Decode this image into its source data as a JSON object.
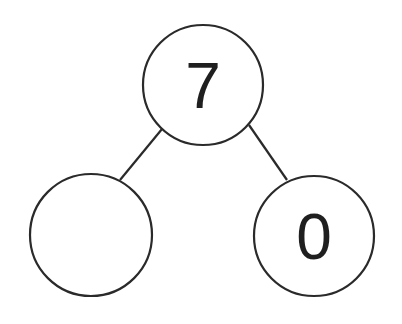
{
  "diagram": {
    "type": "number-bond",
    "whole": {
      "value": "7"
    },
    "parts": [
      {
        "value": ""
      },
      {
        "value": "0"
      }
    ],
    "colors": {
      "stroke": "#2a2a2a",
      "fill": "#ffffff",
      "text": "#1f1f1f"
    }
  }
}
